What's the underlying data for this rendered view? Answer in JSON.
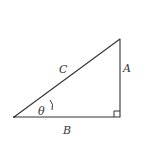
{
  "diagram": {
    "type": "right-triangle",
    "vertices": {
      "left": [
        14,
        117
      ],
      "right_angle": [
        120,
        117
      ],
      "top": [
        120,
        39
      ]
    },
    "labels": {
      "hypotenuse": "C",
      "opposite": "A",
      "adjacent": "B",
      "angle": "θ"
    },
    "stroke_color": "#333333",
    "background": "#ffffff"
  }
}
